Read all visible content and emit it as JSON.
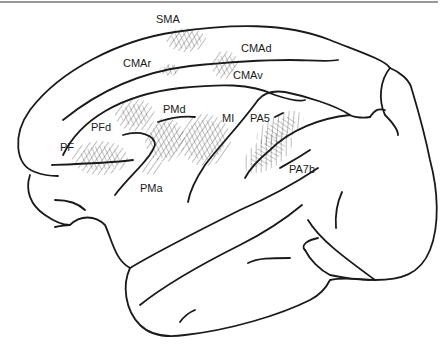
{
  "figure": {
    "line_color": "#1a1a1a",
    "background": "#ffffff",
    "labels": [
      {
        "id": "sma",
        "text": "SMA",
        "x": 156,
        "y": 14
      },
      {
        "id": "cmar",
        "text": "CMAr",
        "x": 123,
        "y": 58
      },
      {
        "id": "cmad",
        "text": "CMAd",
        "x": 241,
        "y": 43
      },
      {
        "id": "cmav",
        "text": "CMAv",
        "x": 233,
        "y": 70
      },
      {
        "id": "pmd",
        "text": "PMd",
        "x": 163,
        "y": 104
      },
      {
        "id": "pfd",
        "text": "PFd",
        "x": 91,
        "y": 122
      },
      {
        "id": "pf",
        "text": "PF",
        "x": 60,
        "y": 142
      },
      {
        "id": "pma",
        "text": "PMa",
        "x": 140,
        "y": 183
      },
      {
        "id": "mi",
        "text": "MI",
        "x": 222,
        "y": 113
      },
      {
        "id": "pa5",
        "text": "PA5",
        "x": 250,
        "y": 113
      },
      {
        "id": "pa7b",
        "text": "PA7b",
        "x": 289,
        "y": 164
      }
    ]
  }
}
